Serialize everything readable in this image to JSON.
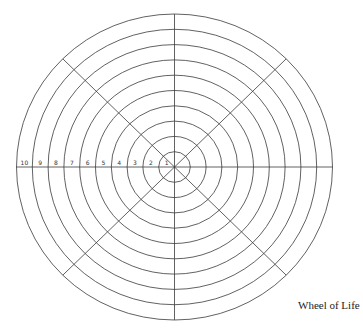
{
  "diagram": {
    "title": "Wheel of Life",
    "rings": 10,
    "spokes": 8,
    "scale_labels": [
      "10",
      "9",
      "8",
      "7",
      "6",
      "5",
      "4",
      "3",
      "2",
      "1"
    ],
    "stroke_color": "#3a3a3a",
    "background": "#ffffff"
  }
}
